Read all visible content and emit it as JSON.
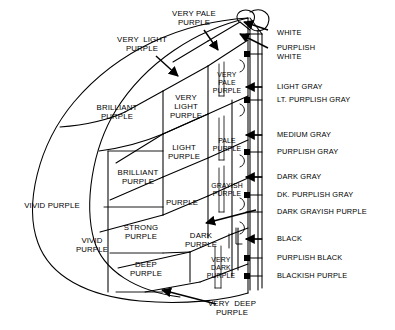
{
  "figure": {
    "background_color": "#ffffff",
    "line_color": "#000000",
    "width": 395,
    "height": 330
  },
  "chroma_labels": [
    {
      "id": "vivid-purple-outer",
      "text": "VIVID PURPLE",
      "x": 52,
      "y": 206,
      "cls": "lbl big"
    },
    {
      "id": "vivid-purple-inner",
      "text": "VIVID\nPURPLE",
      "x": 92,
      "y": 245,
      "cls": "lbl big"
    },
    {
      "id": "brilliant-purple-top",
      "text": "BRILLIANT\nPURPLE",
      "x": 117,
      "y": 112,
      "cls": "lbl big"
    },
    {
      "id": "brilliant-purple-mid",
      "text": "BRILLIANT\nPURPLE",
      "x": 138,
      "y": 177,
      "cls": "lbl big"
    },
    {
      "id": "strong-purple",
      "text": "STRONG\nPURPLE",
      "x": 141,
      "y": 232,
      "cls": "lbl big"
    },
    {
      "id": "deep-purple",
      "text": "DEEP\nPURPLE",
      "x": 146,
      "y": 269,
      "cls": "lbl big"
    },
    {
      "id": "very-light-purple",
      "text": "VERY\nLIGHT\nPURPLE",
      "x": 186,
      "y": 107,
      "cls": "lbl big"
    },
    {
      "id": "light-purple",
      "text": "LIGHT\nPURPLE",
      "x": 184,
      "y": 152,
      "cls": "lbl big"
    },
    {
      "id": "purple",
      "text": "PURPLE",
      "x": 182,
      "y": 203,
      "cls": "lbl big"
    },
    {
      "id": "dark-purple",
      "text": "DARK\nPURPLE",
      "x": 201,
      "y": 240,
      "cls": "lbl big"
    },
    {
      "id": "very-pale-purple-in",
      "text": "VERY\nPALE\nPURPLE",
      "x": 227,
      "y": 83,
      "cls": "lbl sm"
    },
    {
      "id": "pale-purple",
      "text": "PALE\nPURPLE",
      "x": 227,
      "y": 145,
      "cls": "lbl sm"
    },
    {
      "id": "grayish-purple",
      "text": "GRAYISH\nPURPLE",
      "x": 227,
      "y": 190,
      "cls": "lbl sm"
    },
    {
      "id": "very-dark-purple",
      "text": "VERY\nDARK\nPURPLE",
      "x": 221,
      "y": 268,
      "cls": "lbl sm"
    }
  ],
  "callout_labels": [
    {
      "id": "very-light-purple-callout",
      "text": "VERY  LIGHT\nPURPLE",
      "x": 142,
      "y": 44,
      "cls": "lbl big"
    },
    {
      "id": "very-pale-purple-callout",
      "text": "VERY PALE\nPURPLE",
      "x": 194,
      "y": 18,
      "cls": "lbl big"
    },
    {
      "id": "very-deep-purple-callout",
      "text": "VERY  DEEP\nPURPLE",
      "x": 232,
      "y": 308,
      "cls": "lbl big"
    }
  ],
  "neutral_labels": [
    {
      "id": "white",
      "text": "WHITE",
      "x": 277,
      "y": 33
    },
    {
      "id": "purplish-white",
      "text": "PURPLISH\nWHITE",
      "x": 277,
      "y": 53
    },
    {
      "id": "light-gray",
      "text": "LIGHT GRAY",
      "x": 277,
      "y": 87
    },
    {
      "id": "lt-purplish-gray",
      "text": "LT. PURPLISH GRAY",
      "x": 277,
      "y": 100
    },
    {
      "id": "medium-gray",
      "text": "MEDIUM GRAY",
      "x": 277,
      "y": 135
    },
    {
      "id": "purplish-gray",
      "text": "PURPLISH GRAY",
      "x": 277,
      "y": 152
    },
    {
      "id": "dark-gray",
      "text": "DARK GRAY",
      "x": 277,
      "y": 177
    },
    {
      "id": "dk-purplish-gray",
      "text": "DK. PURPLISH GRAY",
      "x": 277,
      "y": 195
    },
    {
      "id": "dark-grayish-purple",
      "text": "DARK GRAYISH PURPLE",
      "x": 277,
      "y": 212
    },
    {
      "id": "black",
      "text": "BLACK",
      "x": 277,
      "y": 239
    },
    {
      "id": "purplish-black",
      "text": "PURPLISH BLACK",
      "x": 277,
      "y": 258
    },
    {
      "id": "blackish-purple",
      "text": "BLACKISH PURPLE",
      "x": 277,
      "y": 276
    }
  ]
}
